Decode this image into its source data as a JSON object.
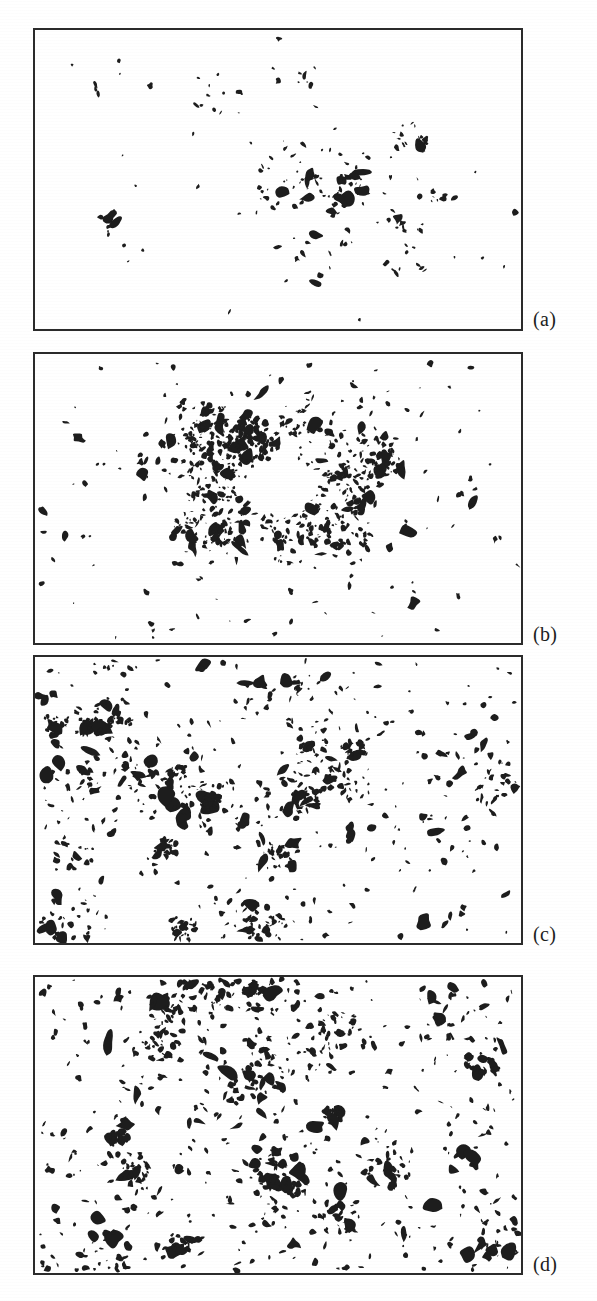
{
  "page": {
    "header_text": "",
    "background_color": "#ffffff",
    "ink_color": "#1d1d1d",
    "width": 597,
    "height": 1301
  },
  "figure": {
    "kind": "multi-panel scanned map figure",
    "panel_count": 4
  },
  "panels": [
    {
      "id": "a",
      "label": "(a)",
      "frame": {
        "x": 33,
        "y": 28,
        "width": 490,
        "height": 303
      },
      "label_pos": {
        "x": 533,
        "y": 308
      },
      "pattern": "compact monocentric core with radial outliers",
      "seed": 101,
      "blob_count": 300,
      "coverage_pct": 6,
      "core": {
        "cx": 0.52,
        "cy": 0.45,
        "radius": 0.2,
        "intensity": 1.0
      },
      "ring": null,
      "spread": 0.34,
      "blob_scale": 1.0
    },
    {
      "id": "b",
      "label": "(b)",
      "frame": {
        "x": 33,
        "y": 352,
        "width": 490,
        "height": 293
      },
      "label_pos": {
        "x": 533,
        "y": 623
      },
      "pattern": "dense ring around a cleared central void, heavy infill",
      "seed": 202,
      "blob_count": 900,
      "coverage_pct": 17,
      "core": {
        "cx": 0.5,
        "cy": 0.45,
        "radius": 0.3,
        "intensity": 1.0
      },
      "ring": {
        "cx": 0.5,
        "cy": 0.45,
        "inner": 0.07,
        "outer": 0.17
      },
      "spread": 0.48,
      "blob_scale": 1.05
    },
    {
      "id": "c",
      "label": "(c)",
      "frame": {
        "x": 33,
        "y": 655,
        "width": 490,
        "height": 290
      },
      "label_pos": {
        "x": 533,
        "y": 923
      },
      "pattern": "broadly dispersed patches filling most of the frame",
      "seed": 303,
      "blob_count": 1000,
      "coverage_pct": 20,
      "core": {
        "cx": 0.48,
        "cy": 0.5,
        "radius": 0.42,
        "intensity": 0.55
      },
      "ring": null,
      "spread": 0.62,
      "blob_scale": 1.1
    },
    {
      "id": "d",
      "label": "(d)",
      "frame": {
        "x": 33,
        "y": 975,
        "width": 490,
        "height": 300
      },
      "label_pos": {
        "x": 533,
        "y": 1253
      },
      "pattern": "near-uniform saturation with coarse coalescing clumps",
      "seed": 404,
      "blob_count": 1100,
      "coverage_pct": 24,
      "core": {
        "cx": 0.45,
        "cy": 0.62,
        "radius": 0.5,
        "intensity": 0.45
      },
      "ring": null,
      "spread": 0.72,
      "blob_scale": 1.25
    }
  ],
  "chart_data": {
    "type": "scatter",
    "title": "",
    "xlabel": "",
    "ylabel": "",
    "subplots": [
      {
        "label": "(a)",
        "approx_patch_count": 300,
        "approx_coverage_pct": 6,
        "spatial_form": "monocentric cluster"
      },
      {
        "label": "(b)",
        "approx_patch_count": 900,
        "approx_coverage_pct": 17,
        "spatial_form": "ring with hollow centre"
      },
      {
        "label": "(c)",
        "approx_patch_count": 1000,
        "approx_coverage_pct": 20,
        "spatial_form": "dispersed"
      },
      {
        "label": "(d)",
        "approx_patch_count": 1100,
        "approx_coverage_pct": 24,
        "spatial_form": "saturated / coalescing"
      }
    ],
    "legend": [],
    "grid": false
  }
}
